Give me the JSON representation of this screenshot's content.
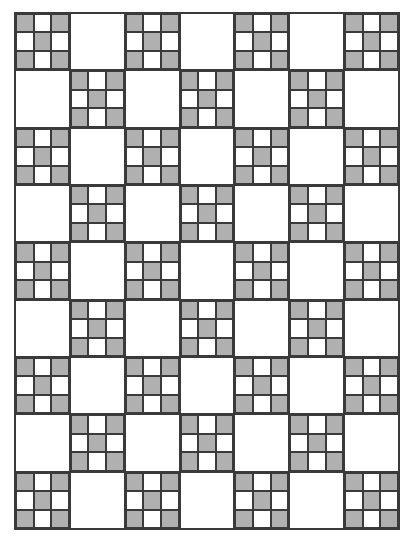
{
  "quilt": {
    "title": "Nine-patch and plain square alternating quilt pattern",
    "columns": 7,
    "rows": 9,
    "layout": "checkerboard",
    "ninepatch_on": "even (row+col)",
    "ninepatch_shaded_cells": [
      0,
      2,
      4,
      6,
      8
    ],
    "colors": {
      "shaded": "#b0b0b0",
      "plain": "#ffffff",
      "line": "#3a3a3a"
    },
    "block_counts": {
      "ninepatch": 32,
      "plain": 31
    }
  }
}
